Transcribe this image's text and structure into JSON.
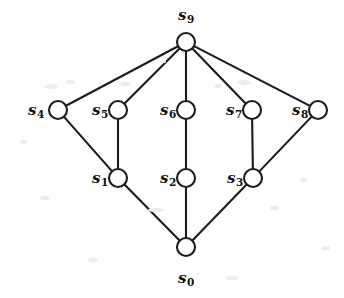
{
  "figure": {
    "background_color": "#fefefe",
    "stroke_color": "#1c1c1c",
    "node_fill_color": "#ffffff",
    "width": 344,
    "height": 298
  },
  "chart_data": {
    "type": "diagram",
    "subtype": "node-link-graph",
    "title": "",
    "node_radius": 9,
    "nodes": [
      {
        "id": "s0",
        "label": "s",
        "subscript": "0",
        "x": 186,
        "y": 247,
        "label_x": 186,
        "label_y": 278,
        "label_position": "below"
      },
      {
        "id": "s1",
        "label": "s",
        "subscript": "1",
        "x": 118,
        "y": 178,
        "label_x": 100,
        "label_y": 178,
        "label_position": "left"
      },
      {
        "id": "s2",
        "label": "s",
        "subscript": "2",
        "x": 186,
        "y": 178,
        "label_x": 168,
        "label_y": 178,
        "label_position": "left"
      },
      {
        "id": "s3",
        "label": "s",
        "subscript": "3",
        "x": 253,
        "y": 178,
        "label_x": 235,
        "label_y": 178,
        "label_position": "left"
      },
      {
        "id": "s4",
        "label": "s",
        "subscript": "4",
        "x": 58,
        "y": 110,
        "label_x": 36,
        "label_y": 110,
        "label_position": "left"
      },
      {
        "id": "s5",
        "label": "s",
        "subscript": "5",
        "x": 118,
        "y": 110,
        "label_x": 100,
        "label_y": 110,
        "label_position": "left"
      },
      {
        "id": "s6",
        "label": "s",
        "subscript": "6",
        "x": 186,
        "y": 110,
        "label_x": 168,
        "label_y": 110,
        "label_position": "left"
      },
      {
        "id": "s7",
        "label": "s",
        "subscript": "7",
        "x": 252,
        "y": 110,
        "label_x": 234,
        "label_y": 110,
        "label_position": "left"
      },
      {
        "id": "s8",
        "label": "s",
        "subscript": "8",
        "x": 318,
        "y": 110,
        "label_x": 300,
        "label_y": 110,
        "label_position": "left"
      },
      {
        "id": "s9",
        "label": "s",
        "subscript": "9",
        "x": 186,
        "y": 42,
        "label_x": 186,
        "label_y": 15,
        "label_position": "above"
      }
    ],
    "edges": [
      {
        "from": "s0",
        "to": "s1"
      },
      {
        "from": "s0",
        "to": "s2"
      },
      {
        "from": "s0",
        "to": "s3"
      },
      {
        "from": "s1",
        "to": "s4"
      },
      {
        "from": "s1",
        "to": "s5"
      },
      {
        "from": "s2",
        "to": "s6"
      },
      {
        "from": "s3",
        "to": "s7"
      },
      {
        "from": "s3",
        "to": "s8"
      },
      {
        "from": "s4",
        "to": "s9"
      },
      {
        "from": "s5",
        "to": "s9"
      },
      {
        "from": "s6",
        "to": "s9"
      },
      {
        "from": "s7",
        "to": "s9"
      },
      {
        "from": "s8",
        "to": "s9"
      }
    ],
    "node_count": 10,
    "edge_count": 13,
    "levels": [
      {
        "level": 0,
        "nodes": [
          "s0"
        ]
      },
      {
        "level": 1,
        "nodes": [
          "s1",
          "s2",
          "s3"
        ]
      },
      {
        "level": 2,
        "nodes": [
          "s4",
          "s5",
          "s6",
          "s7",
          "s8"
        ]
      },
      {
        "level": 3,
        "nodes": [
          "s9"
        ]
      }
    ]
  },
  "specks": [
    {
      "x": 44,
      "y": 84,
      "w": 14,
      "h": 5
    },
    {
      "x": 66,
      "y": 80,
      "w": 9,
      "h": 4
    },
    {
      "x": 120,
      "y": 82,
      "w": 11,
      "h": 4
    },
    {
      "x": 214,
      "y": 84,
      "w": 8,
      "h": 4
    },
    {
      "x": 238,
      "y": 80,
      "w": 13,
      "h": 5
    },
    {
      "x": 40,
      "y": 196,
      "w": 10,
      "h": 4
    },
    {
      "x": 148,
      "y": 208,
      "w": 16,
      "h": 4
    },
    {
      "x": 270,
      "y": 206,
      "w": 9,
      "h": 4
    },
    {
      "x": 300,
      "y": 178,
      "w": 7,
      "h": 4
    },
    {
      "x": 88,
      "y": 258,
      "w": 10,
      "h": 4
    },
    {
      "x": 226,
      "y": 276,
      "w": 12,
      "h": 4
    },
    {
      "x": 20,
      "y": 140,
      "w": 7,
      "h": 4
    },
    {
      "x": 322,
      "y": 246,
      "w": 8,
      "h": 4
    },
    {
      "x": 160,
      "y": 60,
      "w": 6,
      "h": 3
    }
  ]
}
